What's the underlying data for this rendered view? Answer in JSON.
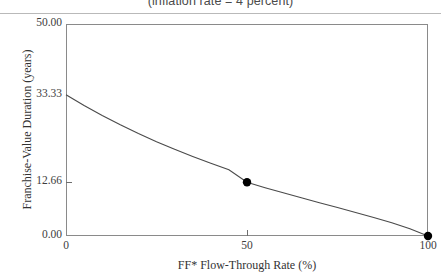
{
  "figure": {
    "subtitle": "(inflation rate = 4 percent)"
  },
  "axis_titles": {
    "x": "FF* Flow-Through Rate (%)",
    "y": "Franchise-Value Duration (years)"
  },
  "ticks": {
    "y": [
      {
        "label": "50.00",
        "value": 50.0
      },
      {
        "label": "33.33",
        "value": 33.33
      },
      {
        "label": "12.66",
        "value": 12.66
      },
      {
        "label": "0.00",
        "value": 0.0
      }
    ],
    "x": [
      {
        "label": "0",
        "value": 0
      },
      {
        "label": "50",
        "value": 50
      },
      {
        "label": "100",
        "value": 100
      }
    ]
  },
  "colors": {
    "curve": "#4a4a4a",
    "marker": "#000000",
    "frame": "#8a8a8a",
    "rule": "#b9b9b9",
    "background": "#ffffff"
  },
  "chart_data": {
    "type": "line",
    "title": "(inflation rate = 4 percent)",
    "xlabel": "FF* Flow-Through Rate (%)",
    "ylabel": "Franchise-Value Duration (years)",
    "xlim": [
      0,
      100
    ],
    "ylim": [
      0,
      50
    ],
    "grid": false,
    "legend": "none",
    "xticks": [
      0,
      50,
      100
    ],
    "yticks": [
      0.0,
      12.66,
      33.33,
      50.0
    ],
    "ytick_labels": [
      "0.00",
      "12.66",
      "33.33",
      "50.00"
    ],
    "series": [
      {
        "name": "Franchise-Value Duration",
        "x": [
          0,
          5,
          10,
          15,
          20,
          25,
          30,
          35,
          40,
          45,
          50,
          55,
          60,
          65,
          70,
          75,
          80,
          85,
          90,
          95,
          100
        ],
        "values": [
          33.33,
          30.8,
          28.44,
          26.24,
          24.18,
          22.25,
          20.44,
          18.74,
          17.14,
          15.64,
          12.66,
          11.4,
          10.18,
          9.0,
          7.84,
          6.7,
          5.55,
          4.38,
          3.14,
          1.73,
          0.0
        ]
      }
    ],
    "markers": [
      {
        "x": 50,
        "y": 12.66,
        "label": "12.66"
      },
      {
        "x": 100,
        "y": 0.0,
        "label": "0.00"
      }
    ],
    "annotations": []
  }
}
